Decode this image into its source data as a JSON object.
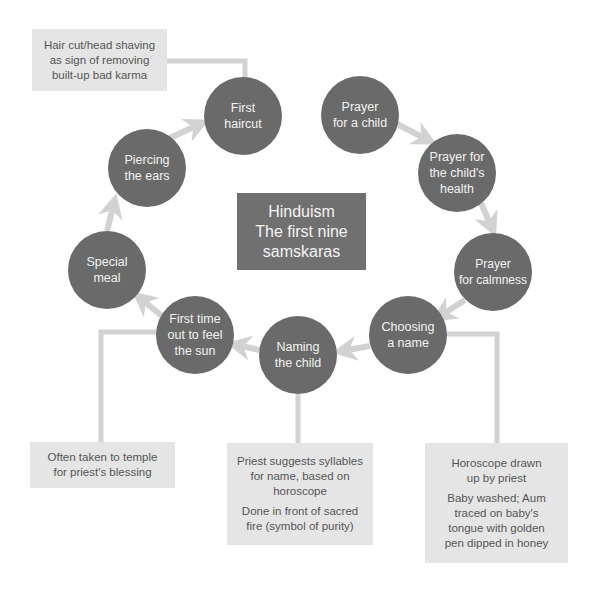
{
  "title": {
    "line1": "Hinduism",
    "line2": "The first nine",
    "line3": "samskaras"
  },
  "stages": [
    {
      "id": "prayer-for-a-child",
      "label": "Prayer\nfor a child"
    },
    {
      "id": "prayer-for-childs-health",
      "label": "Prayer for\nthe child's\nhealth"
    },
    {
      "id": "prayer-for-calmness",
      "label": "Prayer\nfor calmness"
    },
    {
      "id": "choosing-a-name",
      "label": "Choosing\na name"
    },
    {
      "id": "naming-the-child",
      "label": "Naming\nthe child"
    },
    {
      "id": "first-time-out",
      "label": "First time\nout to feel\nthe sun"
    },
    {
      "id": "special-meal",
      "label": "Special\nmeal"
    },
    {
      "id": "piercing-the-ears",
      "label": "Piercing\nthe ears"
    },
    {
      "id": "first-haircut",
      "label": "First\nhaircut"
    }
  ],
  "notes": {
    "haircut": [
      "Hair cut/head shaving\nas sign of removing\nbuilt-up bad karma"
    ],
    "first_time_out": [
      "Often taken to temple\nfor priest's blessing"
    ],
    "naming": [
      "Priest suggests syllables\nfor name, based on\nhoroscope",
      "Done in front of sacred\nfire (symbol of purity)"
    ],
    "choosing": [
      "Horoscope drawn\nup by priest",
      "Baby washed; Aum\ntraced on baby's\ntongue with golden\npen dipped in honey"
    ]
  },
  "colors": {
    "circle": "#6a6a6a",
    "title_box": "#707070",
    "note_box": "#e5e5e5",
    "arrow": "#d2d2d2",
    "note_text": "#555555"
  }
}
